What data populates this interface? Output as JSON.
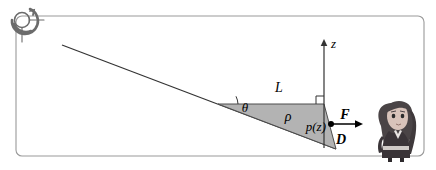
{
  "figure": {
    "title_faint": "",
    "background_color": "#ffffff",
    "frame": {
      "stroke": "#9a9a9a",
      "x": 16,
      "y": 16,
      "width": 408,
      "height": 140,
      "radius": 6
    },
    "icons": {
      "spiral": {
        "name": "spiral-swirl-icon",
        "color": "#6b6b6b",
        "cx": 22,
        "cy": 18,
        "r": 13
      },
      "character": {
        "name": "cartoon-woman-avatar",
        "hair_color": "#4a4446",
        "skin_color": "#d8c3ba",
        "body_color": "#3a3438"
      }
    },
    "shapes": {
      "slope_line": {
        "name": "incline-line",
        "x1": 62,
        "y1": 45,
        "x2": 336,
        "y2": 149,
        "stroke": "#333333"
      },
      "triangle": {
        "name": "shaded-wedge",
        "fill": "#b3b3b3",
        "stroke": "#4d4d4d",
        "apex": [
          218,
          104
        ],
        "top_right": [
          324,
          104
        ],
        "bottom_right": [
          336,
          149
        ]
      },
      "z_axis": {
        "name": "z-axis",
        "x": 324,
        "y_top": 42,
        "y_bottom": 148,
        "stroke": "#333333"
      },
      "force_arrow": {
        "name": "force-arrow",
        "x1": 332,
        "y1": 124,
        "x2": 362,
        "y2": 124,
        "stroke": "#000000"
      },
      "point_marker": {
        "name": "point-dot",
        "cx": 331,
        "cy": 124,
        "r": 3,
        "fill": "#000000"
      },
      "angle_arc": {
        "name": "theta-angle-arc",
        "cx": 218,
        "cy": 104,
        "r": 20
      },
      "right_angle": {
        "name": "right-angle-marker",
        "x": 316,
        "y": 104,
        "size": 8
      }
    },
    "labels": {
      "z": "z",
      "L": "L",
      "rho": "ρ",
      "theta": "θ",
      "p_of_z": "p(z)",
      "F": "F",
      "D": "D"
    }
  }
}
